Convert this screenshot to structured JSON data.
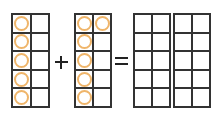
{
  "diagram": {
    "counter_color": "#efb56a",
    "line_color": "#333333",
    "frames": [
      {
        "id": "addend-1",
        "filled": [
          1,
          0,
          1,
          0,
          1,
          0,
          1,
          0,
          1,
          0
        ]
      },
      {
        "id": "addend-2",
        "filled": [
          1,
          1,
          1,
          0,
          1,
          0,
          1,
          0,
          1,
          0
        ]
      },
      {
        "id": "sum-1",
        "filled": [
          0,
          0,
          0,
          0,
          0,
          0,
          0,
          0,
          0,
          0
        ]
      },
      {
        "id": "sum-2",
        "filled": [
          0,
          0,
          0,
          0,
          0,
          0,
          0,
          0,
          0,
          0
        ]
      }
    ],
    "operators": {
      "plus": "+",
      "equals": "="
    },
    "addend_1_count": 5,
    "addend_2_count": 6
  }
}
